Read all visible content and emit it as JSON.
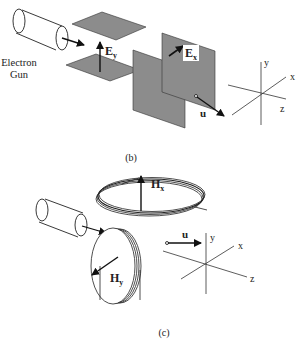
{
  "figure_b": {
    "caption": "(b)",
    "electron_gun_label_line1": "Electron",
    "electron_gun_label_line2": "Gun",
    "field_y_label": "E",
    "field_y_sub": "y",
    "field_x_label": "E",
    "field_x_sub": "x",
    "velocity_label": "u",
    "axes": {
      "x": "x",
      "y": "y",
      "z": "z"
    },
    "plate_color": "#8c8c8c"
  },
  "figure_c": {
    "caption": "(c)",
    "field_x_label": "H",
    "field_x_sub": "x",
    "field_y_label": "H",
    "field_y_sub": "y",
    "velocity_label": "u",
    "axes": {
      "x": "x",
      "y": "y",
      "z": "z"
    }
  }
}
